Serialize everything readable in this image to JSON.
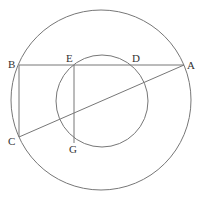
{
  "diagram": {
    "type": "geometry",
    "outer_circle": {
      "cx": 101,
      "cy": 100,
      "r": 90
    },
    "inner_circle": {
      "cx": 102,
      "cy": 101,
      "r": 46
    },
    "points": {
      "A": {
        "x": 184,
        "y": 65,
        "label": "A"
      },
      "B": {
        "x": 19,
        "y": 65,
        "label": "B"
      },
      "C": {
        "x": 19,
        "y": 137,
        "label": "C"
      },
      "D": {
        "x": 136,
        "y": 65,
        "label": "D"
      },
      "E": {
        "x": 74,
        "y": 65,
        "label": "E"
      },
      "G": {
        "x": 74,
        "y": 143,
        "label": "G"
      }
    },
    "segments": [
      "BA",
      "BC",
      "CA",
      "EG"
    ],
    "stroke_color": "#777777",
    "label_color": "#333333"
  }
}
